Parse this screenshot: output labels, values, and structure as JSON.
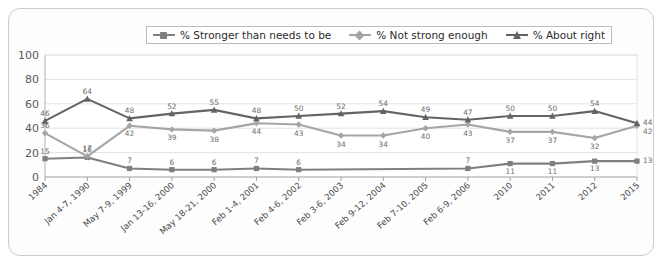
{
  "chart_data": {
    "type": "line",
    "title": "",
    "xlabel": "",
    "ylabel": "",
    "ylim": [
      0,
      100
    ],
    "yticks": [
      0,
      20,
      40,
      60,
      80,
      100
    ],
    "grid": true,
    "legend_position": "top-center",
    "categories": [
      "1984",
      "Jan 4-7, 1990",
      "May 7-9, 1999",
      "Jan 13-16, 2000",
      "May 18-21, 2000",
      "Feb 1-4, 2001",
      "Feb 4-6, 2002",
      "Feb 3-6, 2003",
      "Feb 9-12, 2004",
      "Feb 7-10, 2005",
      "Feb 6-9, 2006",
      "2010",
      "2011",
      "2012",
      "2015"
    ],
    "series": [
      {
        "name": "% Stronger than needs to be",
        "color": "#7f7f7f",
        "marker": "square",
        "values": [
          15,
          16,
          7,
          6,
          6,
          7,
          6,
          null,
          null,
          null,
          7,
          11,
          11,
          13,
          13
        ],
        "labels": [
          "15",
          "16",
          "7",
          "6",
          "6",
          "7",
          "6",
          "",
          "",
          "",
          "7",
          "11",
          "11",
          "13",
          "13"
        ]
      },
      {
        "name": "% Not strong enough",
        "color": "#a5a5a5",
        "marker": "diamond",
        "values": [
          36,
          17,
          42,
          39,
          38,
          44,
          43,
          34,
          34,
          40,
          43,
          37,
          37,
          32,
          42
        ],
        "labels": [
          "36",
          "17",
          "42",
          "39",
          "38",
          "44",
          "43",
          "34",
          "34",
          "40",
          "43",
          "37",
          "37",
          "32",
          "42"
        ]
      },
      {
        "name": "% About right",
        "color": "#646464",
        "marker": "triangle",
        "values": [
          46,
          64,
          48,
          52,
          55,
          48,
          50,
          52,
          54,
          49,
          47,
          50,
          50,
          54,
          44
        ],
        "labels": [
          "46",
          "64",
          "48",
          "52",
          "55",
          "48",
          "50",
          "52",
          "54",
          "49",
          "47",
          "50",
          "50",
          "54",
          "44"
        ]
      }
    ]
  }
}
